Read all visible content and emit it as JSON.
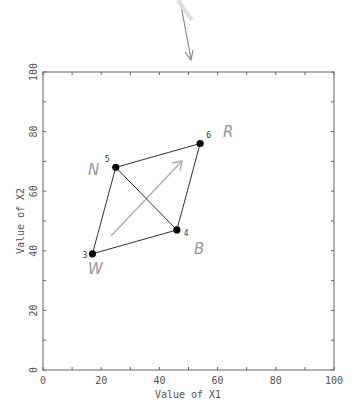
{
  "chart_data": {
    "type": "scatter",
    "title": "",
    "xlabel": "Value of X1",
    "ylabel": "Value of X2",
    "xlim": [
      0,
      100
    ],
    "ylim": [
      0,
      100
    ],
    "x_ticks": [
      0,
      20,
      40,
      60,
      80,
      100
    ],
    "y_ticks": [
      0,
      20,
      40,
      60,
      80,
      100
    ],
    "grid": false,
    "points": [
      {
        "label": "3",
        "x": 17,
        "y": 39,
        "annotation": "W"
      },
      {
        "label": "4",
        "x": 46,
        "y": 47,
        "annotation": "B"
      },
      {
        "label": "5",
        "x": 25,
        "y": 68,
        "annotation": "N"
      },
      {
        "label": "6",
        "x": 54,
        "y": 76,
        "annotation": "R"
      }
    ],
    "edges": [
      [
        "3",
        "5"
      ],
      [
        "5",
        "6"
      ],
      [
        "6",
        "4"
      ],
      [
        "4",
        "3"
      ],
      [
        "5",
        "4"
      ]
    ],
    "annotations": {
      "arrow_inside": {
        "from": [
          23,
          45
        ],
        "to": [
          48,
          70
        ],
        "color": "#aaaaaa"
      },
      "arrow_top": {
        "note": "handwritten arrow pointing down toward the top axis"
      }
    }
  },
  "labels": {
    "xlabel": "Value of X1",
    "ylabel": "Value of X2",
    "x_ticks": [
      "0",
      "20",
      "40",
      "60",
      "80",
      "100"
    ],
    "y_ticks": [
      "0",
      "20",
      "40",
      "60",
      "80",
      "100"
    ],
    "points": [
      "3",
      "4",
      "5",
      "6"
    ],
    "hand": [
      "W",
      "B",
      "N",
      "R"
    ]
  },
  "colors": {
    "axis": "#666666",
    "point": "#000000",
    "edge": "#333333",
    "hand": "#9a9a9a"
  }
}
